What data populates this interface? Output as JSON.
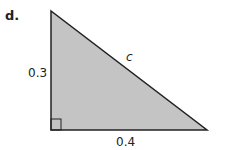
{
  "problem_label": "d.",
  "triangle": {
    "fill": "#c4c4c4",
    "stroke": "#222222",
    "leg_vertical": "0.3",
    "leg_horizontal": "0.4",
    "hypotenuse": "c",
    "right_angle": "bottom-left"
  }
}
